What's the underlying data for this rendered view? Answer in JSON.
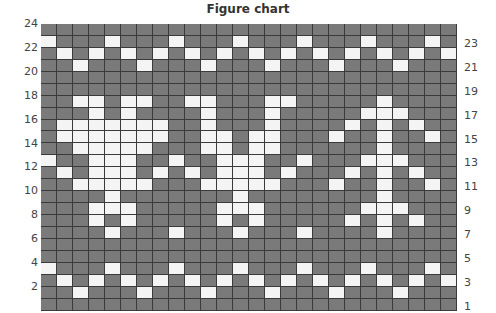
{
  "title": "Figure chart",
  "grid": {
    "columns": 26,
    "rows": 24,
    "colors": {
      "background": "#7a7a7a",
      "pattern": "#f4f4f4",
      "gridline": "#3a3a3a"
    },
    "white_cells_by_row": {
      "24": [],
      "23": [
        0,
        4,
        8,
        12,
        16,
        20,
        24
      ],
      "22": [
        1,
        3,
        5,
        7,
        9,
        11,
        13,
        15,
        17,
        19,
        21,
        23,
        25
      ],
      "21": [
        2,
        6,
        10,
        14,
        18,
        22
      ],
      "20": [],
      "19": [],
      "18": [
        2,
        3,
        5,
        6,
        9,
        10,
        14,
        15,
        21
      ],
      "17": [
        3,
        5,
        10,
        14,
        20,
        21,
        22
      ],
      "16": [
        1,
        2,
        3,
        4,
        5,
        6,
        7,
        10,
        14,
        19,
        21,
        23
      ],
      "15": [
        1,
        2,
        3,
        4,
        5,
        6,
        7,
        10,
        11,
        13,
        14,
        18,
        21,
        24
      ],
      "14": [
        2,
        3,
        4,
        5,
        6,
        10,
        11,
        13,
        14,
        21
      ],
      "13": [
        0,
        3,
        4,
        5,
        8,
        11,
        12,
        13,
        16,
        20,
        21,
        22
      ],
      "12": [
        1,
        3,
        4,
        5,
        7,
        9,
        11,
        12,
        13,
        15,
        19,
        21,
        23
      ],
      "11": [
        2,
        3,
        4,
        5,
        6,
        10,
        11,
        12,
        13,
        14,
        18,
        21,
        24
      ],
      "10": [
        4,
        12,
        21
      ],
      "9": [
        3,
        4,
        5,
        11,
        12,
        13,
        20,
        21,
        22
      ],
      "8": [
        3,
        5,
        11,
        13,
        19,
        21,
        23
      ],
      "7": [
        4,
        8,
        12,
        16,
        21
      ],
      "6": [],
      "5": [],
      "4": [
        0,
        4,
        8,
        12,
        16,
        20,
        24
      ],
      "3": [
        1,
        3,
        5,
        7,
        9,
        11,
        13,
        15,
        17,
        19,
        21,
        23,
        25
      ],
      "2": [
        2,
        6,
        10,
        14,
        18,
        22
      ],
      "1": []
    }
  },
  "row_labels": {
    "left": [
      "24",
      "22",
      "20",
      "18",
      "16",
      "14",
      "12",
      "10",
      "8",
      "6",
      "4",
      "2"
    ],
    "right": [
      "23",
      "21",
      "19",
      "17",
      "15",
      "13",
      "11",
      "9",
      "7",
      "5",
      "3",
      "1"
    ]
  }
}
